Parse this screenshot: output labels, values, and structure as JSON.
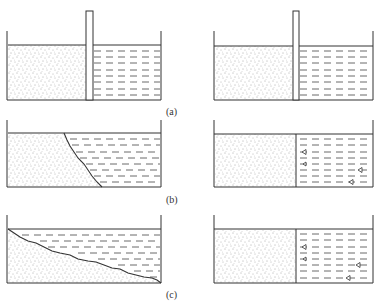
{
  "figure": {
    "colors": {
      "line": "#333333",
      "soil_dot": "#555555",
      "water_dash": "#444444",
      "background": "#ffffff"
    },
    "panels": [
      {
        "id": "a",
        "label": "(a)",
        "left": {
          "type": "soil-wall-water",
          "wall": "vertical plate extending above tank",
          "soil_side": "left",
          "water_side": "right"
        },
        "right": {
          "type": "soil-wall-water",
          "wall": "vertical plate extending above tank",
          "soil_side": "left",
          "water_side": "right"
        }
      },
      {
        "id": "b",
        "label": "(b)",
        "left": {
          "type": "collapsed-soil",
          "boundary": "irregular curve sloping from top-middle to bottom"
        },
        "right": {
          "type": "soil-water-with-seepage",
          "markers": 4,
          "marker_shape": "small triangle flow markers"
        }
      },
      {
        "id": "c",
        "label": "(c)",
        "left": {
          "type": "slope-soil",
          "boundary": "irregular slope from top-left to bottom-right"
        },
        "right": {
          "type": "soil-water-with-seepage",
          "markers": 4,
          "marker_shape": "small triangle flow markers"
        }
      }
    ]
  }
}
